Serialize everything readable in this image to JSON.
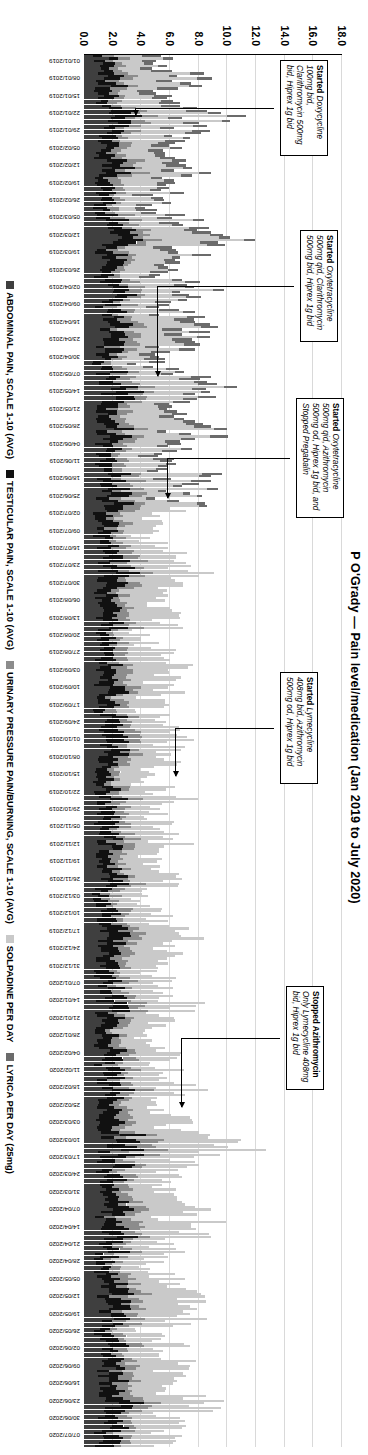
{
  "chart_data": {
    "type": "bar",
    "title": "P O'Grady — Pain level/medication (Jan 2019 to July 2020)",
    "xlabel": "",
    "ylabel": "",
    "ylim": [
      0.0,
      18.0
    ],
    "yticks": [
      "0.0",
      "2.0",
      "4.0",
      "6.0",
      "8.0",
      "10.0",
      "12.0",
      "14.0",
      "16.0",
      "18.0"
    ],
    "grid": true,
    "legend_position": "bottom",
    "stacked": true,
    "series": [
      {
        "name": "ABDOMINAL PAIN, SCALE 1-10 (AVG)",
        "color": "#3f3f3f"
      },
      {
        "name": "TESTICULAR PAIN, SCALE 1-10 (AVG)",
        "color": "#111111"
      },
      {
        "name": "URINARY PRESSURE PAIN/BURNING, SCALE 1-10 (AVG)",
        "color": "#8c8c8c"
      },
      {
        "name": "SOLPADINE PER DAY",
        "color": "#c9c9c9"
      },
      {
        "name": "LYRICA PER DAY (25mg)",
        "color": "#6b6b6b"
      }
    ],
    "categories": [
      "01/01/2019",
      "08/01/2019",
      "15/01/2019",
      "22/01/2019",
      "29/01/2019",
      "05/02/2019",
      "12/02/2019",
      "19/02/2019",
      "26/02/2019",
      "05/03/2019",
      "12/03/2019",
      "19/03/2019",
      "26/03/2019",
      "02/04/2019",
      "09/04/2019",
      "16/04/2019",
      "23/04/2019",
      "30/04/2019",
      "07/05/2019",
      "14/05/2019",
      "21/05/2019",
      "28/05/2019",
      "04/06/2019",
      "11/06/2019",
      "18/06/2019",
      "25/06/2019",
      "02/07/2019",
      "09/07/2019",
      "16/07/2019",
      "23/07/2019",
      "30/07/2019",
      "06/08/2019",
      "13/08/2019",
      "20/08/2019",
      "27/08/2019",
      "03/09/2019",
      "10/09/2019",
      "17/09/2019",
      "24/09/2019",
      "01/10/2019",
      "08/10/2019",
      "15/10/2019",
      "22/10/2019",
      "29/10/2019",
      "05/11/2019",
      "12/11/2019",
      "19/11/2019",
      "26/11/2019",
      "03/12/2019",
      "10/12/2019",
      "17/12/2019",
      "24/12/2019",
      "31/12/2019",
      "07/01/2020",
      "14/01/2020",
      "21/01/2020",
      "28/01/2020",
      "04/02/2020",
      "11/02/2020",
      "18/02/2020",
      "25/02/2020",
      "03/03/2020",
      "10/03/2020",
      "17/03/2020",
      "24/03/2020",
      "31/03/2020",
      "07/04/2020",
      "14/04/2020",
      "21/04/2020",
      "28/04/2020",
      "05/05/2020",
      "12/05/2020",
      "19/05/2020",
      "26/05/2020",
      "02/06/2020",
      "09/06/2020",
      "16/06/2020",
      "23/06/2020",
      "30/06/2020",
      "07/07/2020"
    ],
    "values": {
      "abdominal": [
        1.2,
        1.4,
        1.0,
        1.6,
        1.3,
        1.1,
        1.5,
        1.2,
        1.0,
        1.4,
        1.8,
        1.3,
        1.1,
        1.6,
        1.2,
        1.5,
        1.3,
        1.0,
        1.4,
        1.7,
        1.2,
        1.5,
        1.3,
        1.1,
        1.6,
        1.4,
        1.2,
        1.0,
        1.3,
        1.5,
        1.2,
        1.1,
        1.3,
        1.0,
        1.2,
        1.4,
        1.2,
        1.1,
        1.3,
        1.5,
        1.2,
        1.0,
        1.3,
        1.1,
        1.2,
        1.4,
        1.1,
        1.3,
        1.0,
        1.2,
        1.5,
        1.3,
        1.1,
        1.2,
        1.4,
        1.1,
        1.0,
        1.3,
        1.2,
        1.4,
        1.1,
        1.5,
        2.0,
        1.6,
        1.3,
        1.2,
        1.4,
        1.7,
        1.3,
        1.1,
        1.2,
        1.6,
        1.4,
        1.1,
        1.3,
        1.5,
        1.2,
        1.7,
        1.3,
        1.2
      ],
      "testicular": [
        0.8,
        1.1,
        0.9,
        1.3,
        1.0,
        0.9,
        1.2,
        1.0,
        0.8,
        1.1,
        1.4,
        1.0,
        0.9,
        1.2,
        1.0,
        1.1,
        1.0,
        0.8,
        1.1,
        1.3,
        1.0,
        1.2,
        1.0,
        0.9,
        1.2,
        1.1,
        1.0,
        0.8,
        1.0,
        1.2,
        1.0,
        0.9,
        1.0,
        0.8,
        1.0,
        1.1,
        1.0,
        0.9,
        1.0,
        1.2,
        1.0,
        0.8,
        1.0,
        0.9,
        1.0,
        1.1,
        0.9,
        1.0,
        0.8,
        1.0,
        1.2,
        1.0,
        0.9,
        1.0,
        1.1,
        0.9,
        0.8,
        1.0,
        1.0,
        1.1,
        0.9,
        1.2,
        1.6,
        1.3,
        1.0,
        1.0,
        1.1,
        1.4,
        1.0,
        0.9,
        1.0,
        1.3,
        1.1,
        0.9,
        1.0,
        1.2,
        1.0,
        1.4,
        1.0,
        1.0
      ],
      "urinary": [
        0.6,
        0.9,
        0.7,
        1.0,
        0.8,
        0.7,
        0.9,
        0.8,
        0.6,
        0.9,
        1.1,
        0.8,
        0.7,
        1.0,
        0.8,
        0.9,
        0.8,
        0.6,
        0.9,
        1.0,
        0.8,
        0.9,
        0.8,
        0.7,
        1.0,
        0.9,
        0.8,
        0.6,
        0.8,
        0.9,
        0.8,
        0.7,
        0.8,
        0.6,
        0.8,
        0.9,
        0.8,
        0.7,
        0.8,
        0.9,
        0.8,
        0.6,
        0.8,
        0.7,
        0.8,
        0.9,
        0.7,
        0.8,
        0.6,
        0.8,
        0.9,
        0.8,
        0.7,
        0.8,
        0.9,
        0.7,
        0.6,
        0.8,
        0.8,
        0.9,
        0.7,
        1.0,
        1.3,
        1.0,
        0.8,
        0.8,
        0.9,
        1.1,
        0.8,
        0.7,
        0.8,
        1.0,
        0.9,
        0.7,
        0.8,
        1.0,
        0.8,
        1.1,
        0.8,
        0.8
      ],
      "solpadine": [
        2.4,
        3.1,
        2.0,
        3.6,
        2.8,
        2.2,
        3.0,
        2.5,
        1.9,
        3.0,
        4.0,
        2.6,
        2.1,
        3.4,
        2.4,
        3.0,
        2.6,
        1.8,
        3.0,
        3.6,
        2.4,
        3.1,
        2.6,
        2.0,
        3.2,
        2.8,
        2.4,
        1.8,
        2.6,
        3.0,
        2.4,
        2.1,
        2.6,
        1.8,
        2.4,
        3.0,
        2.4,
        2.0,
        2.6,
        3.2,
        2.6,
        1.8,
        2.6,
        2.0,
        2.4,
        3.0,
        2.1,
        2.6,
        1.8,
        2.4,
        3.2,
        2.6,
        2.0,
        2.4,
        3.0,
        2.1,
        1.8,
        2.6,
        2.4,
        3.0,
        2.1,
        3.4,
        4.6,
        3.6,
        2.6,
        2.4,
        3.0,
        4.0,
        2.6,
        2.0,
        2.4,
        3.6,
        3.0,
        2.1,
        2.6,
        3.2,
        2.4,
        3.8,
        2.6,
        2.4
      ],
      "lyrica": [
        1.0,
        1.0,
        1.0,
        1.0,
        1.0,
        1.0,
        1.0,
        1.0,
        1.0,
        1.0,
        1.0,
        1.0,
        1.0,
        1.0,
        1.0,
        1.0,
        1.0,
        1.0,
        1.0,
        1.0,
        1.0,
        1.0,
        1.0,
        1.0,
        1.0,
        0.6,
        0,
        0,
        0,
        0,
        0,
        0,
        0,
        0,
        0,
        0,
        0,
        0,
        0,
        0,
        0,
        0,
        0,
        0,
        0,
        0,
        0,
        0,
        0,
        0,
        0,
        0,
        0,
        0,
        0,
        0,
        0,
        0,
        0,
        0,
        0,
        0,
        0,
        0,
        0,
        0,
        0,
        0,
        0,
        0,
        0,
        0,
        0,
        0,
        0,
        0,
        0,
        0,
        0,
        0
      ]
    }
  },
  "annotations": [
    {
      "id": "ann-doxycycline",
      "bold": "Started",
      "text": "Doxycycline 100mg bid, Clarithromycin 500mg bid, Hiprex 1g bid",
      "target_date": "22/01/2019"
    },
    {
      "id": "ann-oxytetracycline-1",
      "bold": "Started",
      "text": "Oxytetracycline 500mg qid, Clarithromycin 500mg bid, Hiprex 1g bid",
      "target_date": "07/05/2019"
    },
    {
      "id": "ann-oxytetracycline-2",
      "bold": "Started",
      "text": "Oxytetracycline 500mg qid, Azithromycin 500mg od, Hiprex 1g bid, and Stopped Pregabalin",
      "target_date": "25/06/2019"
    },
    {
      "id": "ann-lymecycline",
      "bold": "Started",
      "text": "Lymecycline 408mg bid, Azithromycin 500mg od, Hiprex 1g bid",
      "target_date": "15/10/2019"
    },
    {
      "id": "ann-stopped-azithromycin",
      "bold": "Stopped Azithromycin",
      "text": "Only Lymecycline 408mg bid, Hiprex 1g bid",
      "target_date": "25/02/2020"
    }
  ],
  "legend": {
    "items": [
      {
        "label": "ABDOMINAL PAIN, SCALE 1-10 (AVG)",
        "color": "#3f3f3f"
      },
      {
        "label": "TESTICULAR PAIN, SCALE 1-10 (AVG)",
        "color": "#111111"
      },
      {
        "label": "URINARY PRESSURE PAIN/BURNING, SCALE 1-10 (AVG)",
        "color": "#8c8c8c"
      },
      {
        "label": "SOLPADINE PER DAY",
        "color": "#c9c9c9"
      },
      {
        "label": "LYRICA PER DAY (25mg)",
        "color": "#6b6b6b"
      }
    ]
  }
}
